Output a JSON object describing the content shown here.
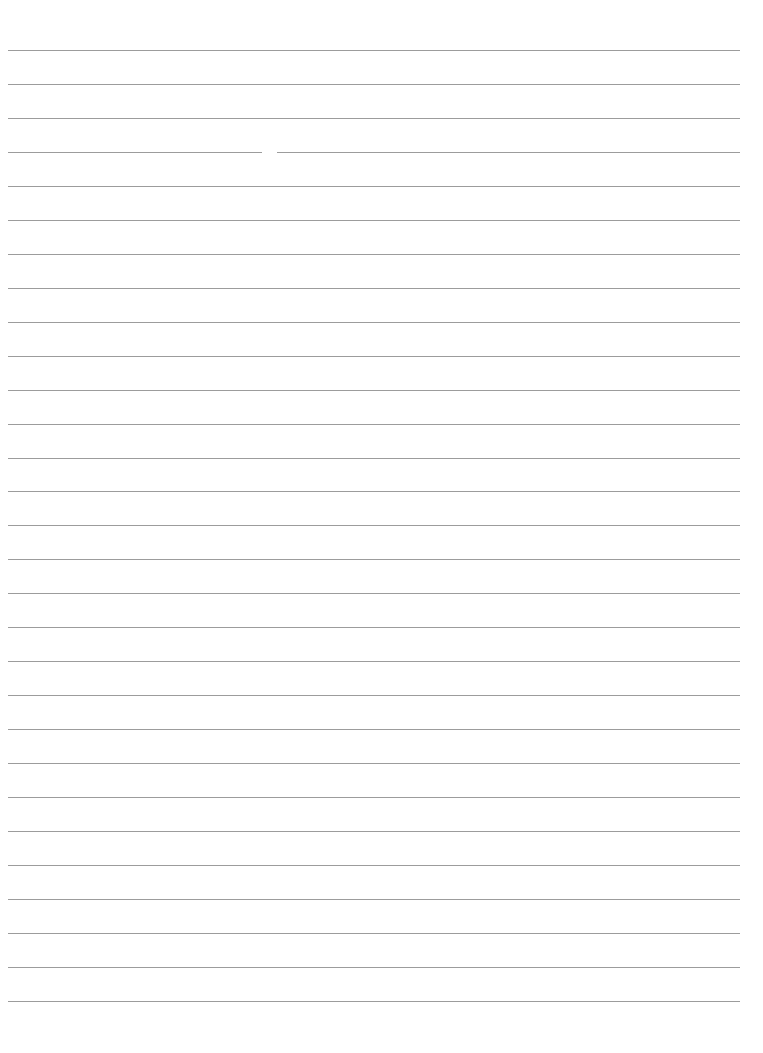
{
  "document": {
    "type": "ruled-paper",
    "ruled_line_count": 29,
    "line_color": "#9c9c9c",
    "text_content": "",
    "lines": [
      {
        "index": 1,
        "text": ""
      },
      {
        "index": 2,
        "text": ""
      },
      {
        "index": 3,
        "text": ""
      },
      {
        "index": 4,
        "text": "",
        "has_gap": true
      },
      {
        "index": 5,
        "text": ""
      },
      {
        "index": 6,
        "text": ""
      },
      {
        "index": 7,
        "text": ""
      },
      {
        "index": 8,
        "text": ""
      },
      {
        "index": 9,
        "text": ""
      },
      {
        "index": 10,
        "text": ""
      },
      {
        "index": 11,
        "text": ""
      },
      {
        "index": 12,
        "text": ""
      },
      {
        "index": 13,
        "text": ""
      },
      {
        "index": 14,
        "text": ""
      },
      {
        "index": 15,
        "text": ""
      },
      {
        "index": 16,
        "text": ""
      },
      {
        "index": 17,
        "text": ""
      },
      {
        "index": 18,
        "text": ""
      },
      {
        "index": 19,
        "text": ""
      },
      {
        "index": 20,
        "text": ""
      },
      {
        "index": 21,
        "text": ""
      },
      {
        "index": 22,
        "text": ""
      },
      {
        "index": 23,
        "text": ""
      },
      {
        "index": 24,
        "text": ""
      },
      {
        "index": 25,
        "text": ""
      },
      {
        "index": 26,
        "text": ""
      },
      {
        "index": 27,
        "text": ""
      },
      {
        "index": 28,
        "text": ""
      },
      {
        "index": 29,
        "text": ""
      }
    ]
  }
}
